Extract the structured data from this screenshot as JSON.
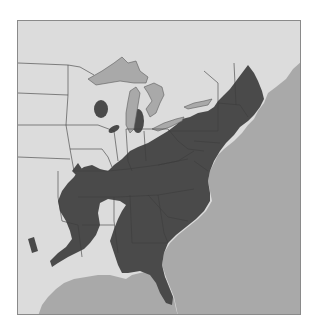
{
  "map": {
    "title": "Species range map — eastern United States",
    "colors": {
      "land": "#dcdcdc",
      "range": "#4a4a4a",
      "water": "#a9a9a9",
      "borders": "#3c3c3c",
      "frame": "#8a8a8a"
    },
    "legend": {
      "range_label": "Range (dark shading)",
      "water_label": "Water (Great Lakes, Atlantic Ocean, Gulf of Mexico)"
    }
  }
}
